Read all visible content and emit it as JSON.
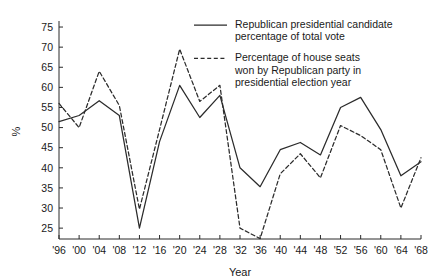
{
  "chart_data": {
    "type": "line",
    "title": "",
    "xlabel": "Year",
    "ylabel": "%",
    "xlim": [
      1896,
      1968
    ],
    "ylim": [
      22.3,
      76.5
    ],
    "yticks": [
      25,
      30,
      35,
      40,
      45,
      50,
      55,
      60,
      65,
      70,
      75
    ],
    "grid": false,
    "legend_position": "top-right",
    "categories": [
      "'96",
      "'00",
      "'04",
      "'08",
      "'12",
      "'16",
      "'20",
      "'24",
      "'28",
      "'32",
      "'36",
      "'40",
      "'44",
      "'48",
      "'52",
      "'56",
      "'60",
      "'64",
      "'68"
    ],
    "x": [
      1896,
      1900,
      1904,
      1908,
      1912,
      1916,
      1920,
      1924,
      1928,
      1932,
      1936,
      1940,
      1944,
      1948,
      1952,
      1956,
      1960,
      1964,
      1968
    ],
    "series": [
      {
        "name": "Republican presidential candidate percentage of total vote",
        "style": "solid",
        "color": "#2b2b2b",
        "values": [
          51.5,
          53.0,
          56.7,
          53.0,
          25.0,
          46.5,
          60.5,
          52.5,
          58.0,
          40.0,
          35.3,
          44.5,
          46.3,
          43.2,
          55.0,
          57.5,
          49.5,
          38.0,
          41.5
        ]
      },
      {
        "name": "Percentage of house seats won by Republican party in presidential election year",
        "style": "dashed",
        "color": "#2b2b2b",
        "values": [
          56.0,
          50.0,
          64.0,
          55.5,
          29.7,
          49.5,
          69.5,
          56.5,
          60.5,
          25.0,
          22.4,
          38.5,
          43.5,
          37.5,
          50.5,
          48.0,
          44.5,
          30.0,
          42.5
        ]
      }
    ]
  },
  "legend": {
    "entries": [
      {
        "label_lines": [
          "Republican presidential candidate",
          "percentage of total vote"
        ],
        "style": "solid"
      },
      {
        "label_lines": [
          "Percentage of house seats",
          "won by Republican party in",
          "presidential election year"
        ],
        "style": "dashed"
      }
    ]
  },
  "axes": {
    "x_title": "Year",
    "y_title": "%"
  }
}
